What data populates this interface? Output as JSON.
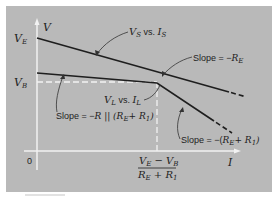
{
  "diagram": {
    "background_color": "#b9b9b9",
    "line_color": "#1e1e1e",
    "axis_color": "#f2f2f2",
    "axes": {
      "y_label": "V",
      "x_label": "I",
      "origin_label": "0"
    },
    "y_ticks": [
      {
        "main": "V",
        "sub": "E"
      },
      {
        "main": "V",
        "sub": "B"
      }
    ],
    "x_tick": {
      "numerator": "V",
      "numerator_sub1": "E",
      "numerator_minus": " − ",
      "numerator2": "V",
      "numerator_sub2": "B",
      "denominator": "R",
      "denominator_sub1": "E",
      "denominator_plus": " + ",
      "denominator2": "R",
      "denominator_sub2": "1"
    },
    "curves": [
      {
        "name": "VS vs IS",
        "label_main1": "V",
        "label_sub1": "S",
        "label_mid": " vs. ",
        "label_main2": "I",
        "label_sub2": "S"
      },
      {
        "name": "VL vs IL",
        "label_main1": "V",
        "label_sub1": "L",
        "label_mid": " vs. ",
        "label_main2": "I",
        "label_sub2": "L"
      }
    ],
    "annotations": [
      {
        "prefix": "Slope = −",
        "expr": "R",
        "sub": "E"
      },
      {
        "prefix": "Slope = −",
        "expr": "R || (R",
        "sub": "E",
        "suffix": "+ R",
        "sub2": "1",
        "close": ")"
      },
      {
        "prefix": "Slope = −(",
        "expr": "R",
        "sub": "E",
        "suffix": "+ R",
        "sub2": "1",
        "close": ")"
      }
    ]
  }
}
